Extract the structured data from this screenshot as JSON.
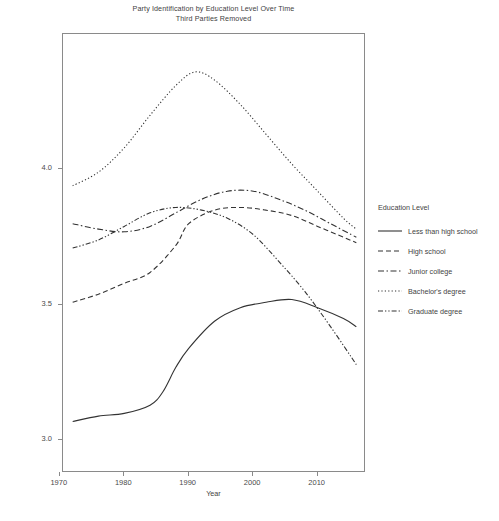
{
  "chart_data": {
    "type": "line",
    "title": "Party Identification by Education Level Over Time",
    "subtitle": "Third Parties Removed",
    "xlabel": "Year",
    "ylabel_line1": "Mean Party Identification",
    "ylabel_line2": "1 = Strong Democrat, 7 = Strong Republican",
    "xlim": [
      1970,
      1970
    ],
    "x_ticks": [
      "1970",
      "1980",
      "1990",
      "2000",
      "2010"
    ],
    "x_tick_values": [
      1970,
      1980,
      1990,
      2000,
      2010
    ],
    "y_ticks": [
      "3.0",
      "3.5",
      "4.0"
    ],
    "y_tick_values": [
      3.0,
      3.5,
      4.0
    ],
    "x_range": [
      1970.5,
      2017.5
    ],
    "y_range": [
      2.88,
      4.5
    ],
    "grid": false,
    "legend_position": "right",
    "legend_title": "Education Level",
    "series": [
      {
        "name": "Less than high school",
        "dash": "solid",
        "x": [
          1972,
          1976,
          1980,
          1984,
          1986,
          1988,
          1990,
          1994,
          1998,
          2002,
          2006,
          2010,
          2014,
          2016
        ],
        "values": [
          3.07,
          3.09,
          3.1,
          3.13,
          3.18,
          3.27,
          3.34,
          3.44,
          3.49,
          3.51,
          3.52,
          3.49,
          3.45,
          3.42
        ]
      },
      {
        "name": "High school",
        "dash": "dashed",
        "x": [
          1972,
          1976,
          1980,
          1984,
          1988,
          1990,
          1994,
          1998,
          2002,
          2006,
          2010,
          2014,
          2016
        ],
        "values": [
          3.51,
          3.54,
          3.58,
          3.62,
          3.72,
          3.8,
          3.85,
          3.86,
          3.85,
          3.83,
          3.79,
          3.75,
          3.73
        ]
      },
      {
        "name": "Junior college",
        "dash": "dashdot",
        "x": [
          1972,
          1976,
          1980,
          1984,
          1988,
          1992,
          1996,
          2000,
          2004,
          2008,
          2012,
          2016
        ],
        "values": [
          3.8,
          3.78,
          3.77,
          3.79,
          3.84,
          3.89,
          3.92,
          3.92,
          3.89,
          3.85,
          3.8,
          3.75
        ]
      },
      {
        "name": "Bachelor's degree",
        "dash": "dotted",
        "x": [
          1972,
          1976,
          1980,
          1984,
          1988,
          1991,
          1994,
          1998,
          2002,
          2006,
          2010,
          2014,
          2016
        ],
        "values": [
          3.94,
          3.99,
          4.08,
          4.2,
          4.31,
          4.36,
          4.33,
          4.24,
          4.13,
          4.02,
          3.92,
          3.82,
          3.78
        ]
      },
      {
        "name": "Graduate degree",
        "dash": "dashdotdot",
        "x": [
          1972,
          1976,
          1980,
          1984,
          1988,
          1992,
          1996,
          2000,
          2004,
          2008,
          2012,
          2016
        ],
        "values": [
          3.71,
          3.74,
          3.79,
          3.84,
          3.86,
          3.85,
          3.82,
          3.76,
          3.66,
          3.55,
          3.42,
          3.28
        ]
      }
    ],
    "line_color": "#333333"
  }
}
